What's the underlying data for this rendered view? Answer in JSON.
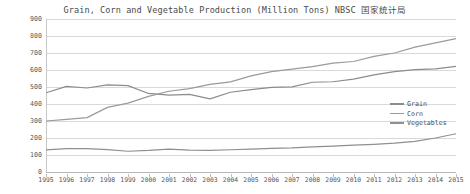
{
  "chart_data": {
    "type": "line",
    "title": "Grain, Corn and Vegetable Production (Million Tons) NBSC 国家统计局",
    "xlabel": "",
    "ylabel": "",
    "ylim": [
      0,
      900
    ],
    "yticks": [
      0,
      100,
      200,
      300,
      400,
      500,
      600,
      700,
      800,
      900
    ],
    "grid": true,
    "legend_position": "right-middle",
    "categories": [
      1995,
      1996,
      1997,
      1998,
      1999,
      2000,
      2001,
      2002,
      2003,
      2004,
      2005,
      2006,
      2007,
      2008,
      2009,
      2010,
      2011,
      2012,
      2013,
      2014,
      2015
    ],
    "series": [
      {
        "name": "Grain",
        "color": "#8c8c8c",
        "values": [
          466,
          504,
          494,
          512,
          508,
          462,
          452,
          457,
          430,
          469,
          484,
          498,
          501,
          528,
          531,
          546,
          571,
          590,
          602,
          607,
          621
        ]
      },
      {
        "name": "Corn",
        "color": "#9a9a9a",
        "values": [
          300,
          310,
          320,
          380,
          405,
          445,
          475,
          490,
          515,
          530,
          565,
          590,
          605,
          620,
          640,
          650,
          680,
          700,
          735,
          760,
          785
        ]
      },
      {
        "name": "Vegetables",
        "color": "#8f8f8f",
        "values": [
          130,
          138,
          137,
          132,
          122,
          127,
          135,
          129,
          127,
          131,
          135,
          139,
          142,
          148,
          152,
          158,
          163,
          170,
          180,
          200,
          225
        ]
      }
    ]
  },
  "legend": {
    "items": [
      {
        "label": "Grain"
      },
      {
        "label": "Corn"
      },
      {
        "label": "Vegetables"
      }
    ]
  }
}
